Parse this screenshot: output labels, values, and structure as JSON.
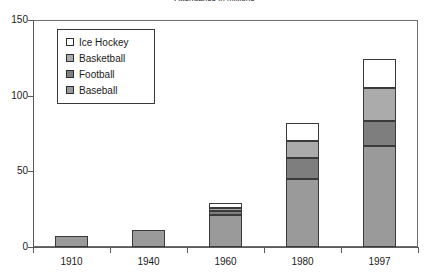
{
  "chart_data": {
    "type": "bar",
    "subtype": "stacked-bar",
    "title": "Attendance in millions",
    "xlabel": "",
    "ylabel": "",
    "categories": [
      "1910",
      "1940",
      "1960",
      "1980",
      "1997"
    ],
    "ylim": [
      0,
      150
    ],
    "yticks": [
      0,
      50,
      100,
      150
    ],
    "ytick_labels": [
      "0",
      "50",
      "100",
      "150"
    ],
    "grid": false,
    "legend_position": "upper-left-inside",
    "series": [
      {
        "name": "Baseball",
        "color": "#9a9a9a",
        "values": [
          7,
          11,
          21,
          45,
          67
        ]
      },
      {
        "name": "Football",
        "color": "#7e7e7e",
        "values": [
          0,
          0,
          3,
          14,
          16
        ]
      },
      {
        "name": "Basketball",
        "color": "#ababab",
        "values": [
          0,
          0,
          2,
          11,
          22
        ]
      },
      {
        "name": "Ice Hockey",
        "color": "#ffffff",
        "values": [
          0,
          0,
          3,
          12,
          19
        ]
      }
    ],
    "totals": [
      7,
      11,
      29,
      82,
      124
    ],
    "stack_tops": {
      "1910": {
        "baseball": 7,
        "football": 7,
        "basketball": 7,
        "ice_hockey": 7
      },
      "1940": {
        "baseball": 11,
        "football": 11,
        "basketball": 11,
        "ice_hockey": 11
      },
      "1960": {
        "baseball": 21,
        "football": 24,
        "basketball": 26,
        "ice_hockey": 29
      },
      "1980": {
        "baseball": 45,
        "football": 59,
        "basketball": 70,
        "ice_hockey": 82
      },
      "1997": {
        "baseball": 67,
        "football": 83,
        "basketball": 105,
        "ice_hockey": 124
      }
    }
  },
  "legend": {
    "items": [
      {
        "label": "Ice Hockey",
        "color": "#ffffff"
      },
      {
        "label": "Basketball",
        "color": "#ababab"
      },
      {
        "label": "Football",
        "color": "#7e7e7e"
      },
      {
        "label": "Baseball",
        "color": "#9a9a9a"
      }
    ]
  },
  "colors": {
    "axis": "#5a5a5a",
    "frame": "#6e6e6e",
    "bar_outline": "#3a3a3a",
    "text": "#1a1a1a",
    "background": "#ffffff"
  }
}
